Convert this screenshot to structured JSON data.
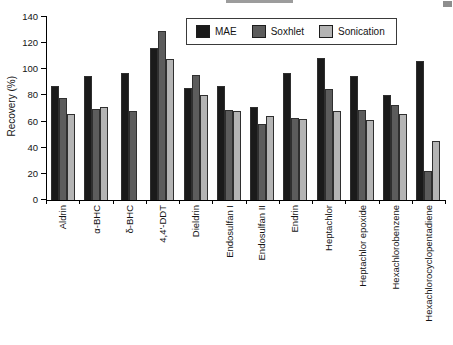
{
  "figure": {
    "background": "#ffffff",
    "axis_color": "#000000"
  },
  "chart_data": {
    "type": "bar",
    "title": "",
    "xlabel": "",
    "ylabel": "Recovery (%)",
    "ylim": [
      0,
      140
    ],
    "yticks": [
      0,
      20,
      40,
      60,
      80,
      100,
      120,
      140
    ],
    "grid": false,
    "legend_position": "top-center-inside-box",
    "categories": [
      "Aldrin",
      "α-BHC",
      "δ-BHC",
      "4,4'-DDT",
      "Dieldrin",
      "Endosulfan I",
      "Endosulfan II",
      "Endrin",
      "Heptachlor",
      "Heptachlor epoxide",
      "Hexachlorobenzene",
      "Hexachlorocyclopentadiene"
    ],
    "series": [
      {
        "name": "MAE",
        "color": "#1a1a1a",
        "values": [
          87,
          95,
          97,
          116,
          86,
          87,
          71,
          97,
          109,
          95,
          80,
          106
        ]
      },
      {
        "name": "Soxhlet",
        "color": "#5c5c5c",
        "values": [
          78,
          70,
          68,
          129,
          96,
          69,
          58,
          63,
          85,
          69,
          73,
          22
        ]
      },
      {
        "name": "Sonication",
        "color": "#b4b4b4",
        "values": [
          66,
          71,
          null,
          108,
          80,
          68,
          64,
          62,
          68,
          61,
          66,
          45
        ]
      }
    ]
  }
}
